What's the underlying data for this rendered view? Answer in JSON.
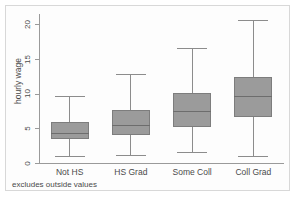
{
  "chart_data": {
    "type": "box",
    "title": "",
    "xlabel": "",
    "ylabel": "hourly wage",
    "ylim": [
      0,
      21.5
    ],
    "yticks": [
      0,
      5,
      10,
      15,
      20
    ],
    "ytick_labels": [
      "0",
      "5",
      "10",
      "15",
      "20"
    ],
    "grid": false,
    "legend": null,
    "footnote": "excludes outside values",
    "categories": [
      "Not HS",
      "HS Grad",
      "Some Coll",
      "Coll Grad"
    ],
    "boxes": [
      {
        "category": "Not HS",
        "min": 1.0,
        "q1": 3.4,
        "median": 4.4,
        "q3": 5.9,
        "max": 9.6
      },
      {
        "category": "HS Grad",
        "min": 1.1,
        "q1": 4.1,
        "median": 5.5,
        "q3": 7.6,
        "max": 12.8
      },
      {
        "category": "Some Coll",
        "min": 1.6,
        "q1": 5.2,
        "median": 7.5,
        "q3": 10.1,
        "max": 16.6
      },
      {
        "category": "Coll Grad",
        "min": 1.0,
        "q1": 6.6,
        "median": 9.6,
        "q3": 12.4,
        "max": 20.6
      }
    ],
    "colors": {
      "box_fill": "#9b9b9b",
      "box_border": "#7d7d7d",
      "median": "#6d6d6d",
      "whisker": "#8c8c8c",
      "axis": "#9a9a9a",
      "text": "#4a4a4a",
      "plot_background": "#fdfdfd",
      "frame_border": "#d8d8d8"
    }
  }
}
